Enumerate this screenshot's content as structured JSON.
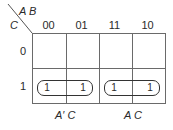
{
  "kmap": {
    "corner": {
      "col_vars": "A B",
      "row_vars": "C"
    },
    "columns": [
      "00",
      "01",
      "11",
      "10"
    ],
    "rows": [
      "0",
      "1"
    ],
    "cells": [
      [
        "",
        "",
        "",
        ""
      ],
      [
        "1",
        "1",
        "1",
        "1"
      ]
    ],
    "groups": [
      {
        "label": "A′ C",
        "covers": "row 1, columns 00–01"
      },
      {
        "label": "A C",
        "covers": "row 1, columns 11–10"
      }
    ]
  }
}
